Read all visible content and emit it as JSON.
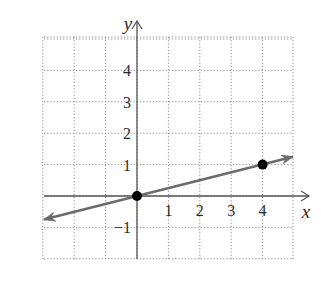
{
  "chart_data": {
    "type": "line",
    "title": "",
    "xlabel": "x",
    "ylabel": "y",
    "xlim": [
      -3,
      5
    ],
    "ylim": [
      -2,
      5
    ],
    "grid": true,
    "grid_style": "dotted",
    "x_ticks": [
      1,
      2,
      3,
      4
    ],
    "x_tick_labels": [
      "1",
      "2",
      "3",
      "4"
    ],
    "y_ticks": [
      4,
      3,
      2,
      1,
      -1
    ],
    "y_tick_labels": [
      "4",
      "3",
      "2",
      "1",
      "−1"
    ],
    "series": [
      {
        "name": "line y = x/4",
        "slope": 0.25,
        "intercept": 0,
        "extends_both_directions": true,
        "x": [
          -3,
          5
        ],
        "y": [
          -0.75,
          1.25
        ]
      }
    ],
    "points": [
      {
        "x": 0,
        "y": 0
      },
      {
        "x": 4,
        "y": 1
      }
    ],
    "legend": null
  },
  "colors": {
    "line": "#6b6b6b",
    "axis": "#555555",
    "grid": "#8a8a8a",
    "point": "#000000",
    "text": "#2a2a2a"
  },
  "layout": {
    "origin_px": [
      137,
      196
    ],
    "unit_px": 31.4,
    "grid_left": 44,
    "grid_right": 293,
    "grid_top": 37,
    "grid_bottom": 259
  }
}
